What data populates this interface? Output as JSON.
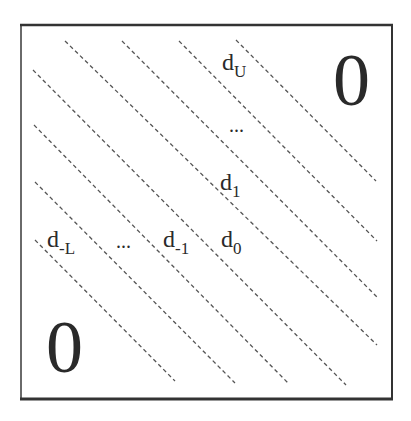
{
  "diagram": {
    "frame": {
      "x": 21,
      "y": 25,
      "width": 371,
      "height": 374,
      "color": "#333333"
    },
    "line_color": "#555555",
    "diagonals": [
      {
        "x1": 35,
        "y1": 240,
        "x2": 175,
        "y2": 381
      },
      {
        "x1": 35,
        "y1": 182,
        "x2": 235,
        "y2": 383
      },
      {
        "x1": 34,
        "y1": 125,
        "x2": 288,
        "y2": 383
      },
      {
        "x1": 33,
        "y1": 70,
        "x2": 346,
        "y2": 385
      },
      {
        "x1": 65,
        "y1": 41,
        "x2": 377,
        "y2": 345
      },
      {
        "x1": 122,
        "y1": 41,
        "x2": 377,
        "y2": 297
      },
      {
        "x1": 179,
        "y1": 41,
        "x2": 377,
        "y2": 241
      },
      {
        "x1": 236,
        "y1": 40,
        "x2": 376,
        "y2": 181
      }
    ],
    "labels": {
      "d_U": {
        "base": "d",
        "sub": "U"
      },
      "upper_dots": "...",
      "d_1": {
        "base": "d",
        "sub": "1"
      },
      "d_negL": {
        "base": "d",
        "sub": "-L"
      },
      "lower_dots": "...",
      "d_neg1": {
        "base": "d",
        "sub": "-1"
      },
      "d_0": {
        "base": "d",
        "sub": "0"
      }
    },
    "zero_upper": "0",
    "zero_lower": "0"
  }
}
